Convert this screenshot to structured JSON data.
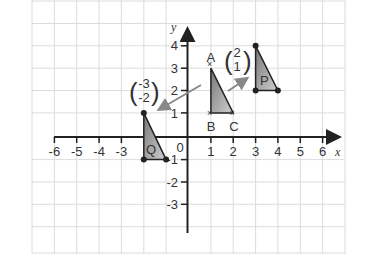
{
  "diagram": {
    "type": "coordinate-grid-translation",
    "axes": {
      "x_label": "x",
      "y_label": "y",
      "origin_label": "0",
      "x_ticks": [
        "-6",
        "-5",
        "-4",
        "-3",
        "1",
        "2",
        "3",
        "4",
        "5",
        "6"
      ],
      "y_ticks": [
        "4",
        "3",
        "2",
        "1",
        "-1",
        "-2",
        "-3"
      ]
    },
    "shapes": {
      "original": {
        "name": "ABC",
        "vertices": {
          "A": [
            1,
            3
          ],
          "B": [
            1,
            1
          ],
          "C": [
            2,
            1
          ]
        },
        "labels": [
          "A",
          "B",
          "C"
        ]
      },
      "P": {
        "label": "P",
        "vertices": [
          [
            3,
            4
          ],
          [
            3,
            2
          ],
          [
            4,
            2
          ]
        ]
      },
      "Q": {
        "label": "Q",
        "vertices": [
          [
            -2,
            1
          ],
          [
            -2,
            -1
          ],
          [
            -1,
            -1
          ]
        ]
      }
    },
    "vectors": {
      "to_P": {
        "top": "2",
        "bottom": "1"
      },
      "to_Q": {
        "top": "-3",
        "bottom": "-2"
      }
    },
    "colors": {
      "grid": "#dddddd",
      "axis": "#222222",
      "triangle_fill": "#999999",
      "arrow": "#888888"
    }
  }
}
